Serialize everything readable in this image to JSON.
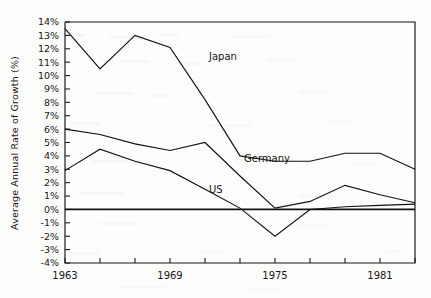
{
  "chart_data": {
    "type": "line",
    "title": "",
    "xlabel": "",
    "ylabel": "Average Annual Rate of Growth (%)",
    "ylim": [
      -4,
      14
    ],
    "xlim": [
      1963,
      1983
    ],
    "grid": false,
    "legend_position": "inline-labels",
    "y_tick_labels": [
      "14%",
      "13%",
      "12%",
      "11%",
      "10%",
      "9%",
      "8%",
      "7%",
      "6%",
      "5%",
      "4%",
      "3%",
      "2%",
      "1%",
      "0%",
      "-1%",
      "-2%",
      "-3%",
      "-4%"
    ],
    "y_tick_values": [
      14,
      13,
      12,
      11,
      10,
      9,
      8,
      7,
      6,
      5,
      4,
      3,
      2,
      1,
      0,
      -1,
      -2,
      -3,
      -4
    ],
    "x_tick_values": [
      1963,
      1965,
      1967,
      1969,
      1971,
      1973,
      1975,
      1977,
      1979,
      1981,
      1983
    ],
    "x_tick_labels": [
      "1963",
      "",
      "",
      "1969",
      "",
      "",
      "1975",
      "",
      "",
      "1981",
      ""
    ],
    "x_labeled_ticks": [
      {
        "value": 1963,
        "label": "1963"
      },
      {
        "value": 1969,
        "label": "1969"
      },
      {
        "value": 1975,
        "label": "1975"
      },
      {
        "value": 1981,
        "label": "1981"
      }
    ],
    "x": [
      1963,
      1965,
      1967,
      1969,
      1971,
      1973,
      1975,
      1977,
      1979,
      1981,
      1983
    ],
    "series": [
      {
        "name": "Japan",
        "label": "Japan",
        "color": "#121212",
        "values": [
          13.5,
          10.5,
          13.0,
          12.1,
          8.2,
          4.0,
          3.6,
          3.6,
          4.2,
          4.2,
          3.0
        ],
        "label_x": 1971,
        "label_y": 11.4
      },
      {
        "name": "Germany",
        "label": "Germany",
        "color": "#121212",
        "values": [
          6.0,
          5.6,
          4.9,
          4.4,
          5.0,
          2.5,
          0.1,
          0.6,
          1.8,
          1.1,
          0.5
        ],
        "label_x": 1973,
        "label_y": 3.8
      },
      {
        "name": "US",
        "label": "US",
        "color": "#121212",
        "values": [
          2.9,
          4.5,
          3.6,
          2.9,
          1.5,
          0.1,
          -2.0,
          0.0,
          0.2,
          0.3,
          0.4
        ],
        "label_x": 1971,
        "label_y": 1.5
      }
    ]
  },
  "axis": {
    "y_title": "Average Annual Rate of Growth (%)"
  }
}
